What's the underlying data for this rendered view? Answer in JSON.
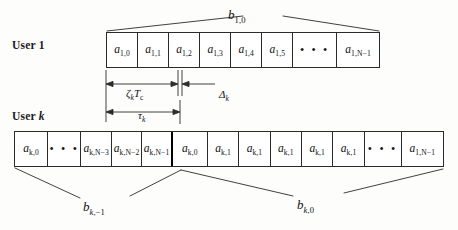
{
  "figure": {
    "users": [
      {
        "id": "user1",
        "label_prefix": "User ",
        "label_index": "1"
      },
      {
        "id": "userk",
        "label_prefix": "User ",
        "label_index": "k"
      }
    ],
    "rows": {
      "user1": {
        "cells": [
          {
            "type": "symbol",
            "base": "a",
            "sub": "1,0"
          },
          {
            "type": "symbol",
            "base": "a",
            "sub": "1,1"
          },
          {
            "type": "symbol",
            "base": "a",
            "sub": "1,2"
          },
          {
            "type": "symbol",
            "base": "a",
            "sub": "1,3"
          },
          {
            "type": "symbol",
            "base": "a",
            "sub": "1,4"
          },
          {
            "type": "symbol",
            "base": "a",
            "sub": "1,5"
          },
          {
            "type": "ellipsis",
            "text": "• • •"
          },
          {
            "type": "symbol",
            "base": "a",
            "sub": "1,N−1"
          }
        ]
      },
      "userk": {
        "cells": [
          {
            "type": "symbol",
            "base": "a",
            "sub": "k,0"
          },
          {
            "type": "ellipsis",
            "text": "• • •"
          },
          {
            "type": "symbol",
            "base": "a",
            "sub": "k,N−3"
          },
          {
            "type": "symbol",
            "base": "a",
            "sub": "k,N−2"
          },
          {
            "type": "symbol",
            "base": "a",
            "sub": "k,N−1"
          },
          {
            "type": "symbol",
            "base": "a",
            "sub": "k,0"
          },
          {
            "type": "symbol",
            "base": "a",
            "sub": "k,1"
          },
          {
            "type": "symbol",
            "base": "a",
            "sub": "k,1"
          },
          {
            "type": "symbol",
            "base": "a",
            "sub": "k,1"
          },
          {
            "type": "symbol",
            "base": "a",
            "sub": "k,1"
          },
          {
            "type": "symbol",
            "base": "a",
            "sub": "k,1"
          },
          {
            "type": "ellipsis",
            "text": "• • •"
          },
          {
            "type": "symbol",
            "base": "a",
            "sub": "1,N−1"
          }
        ]
      }
    },
    "bit_braces": [
      {
        "name": "b-1-0",
        "base": "b",
        "sub": "1,0"
      },
      {
        "name": "b-k--1",
        "base": "b",
        "sub": "k,−1"
      },
      {
        "name": "b-k-0",
        "base": "b",
        "sub": "k,0"
      }
    ],
    "measures": [
      {
        "name": "zeta-k-tc",
        "base": "ζ",
        "sub": "k",
        "suffix": "T",
        "suffix_sub": "c"
      },
      {
        "name": "delta-k",
        "base": "Δ",
        "sub": "k"
      },
      {
        "name": "tau-k",
        "base": "τ",
        "sub": "k"
      }
    ],
    "colors": {
      "ink": "#111111",
      "rule": "#2b2b2b",
      "divider": "#000000",
      "background": "#fdfdfc"
    }
  }
}
